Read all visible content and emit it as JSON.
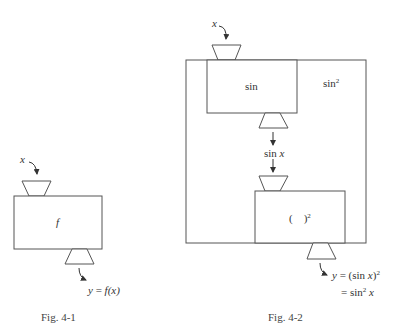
{
  "figures": [
    {
      "id": "fig-4-1",
      "caption": "Fig. 4-1",
      "input_label": "x",
      "box_label": "f",
      "output_label": "y = f(x)",
      "output_var": "y",
      "output_eq": "= ",
      "output_expr": "f(x)"
    },
    {
      "id": "fig-4-2",
      "caption": "Fig. 4-2",
      "input_label": "x",
      "outer_box_label": "sin",
      "outer_box_label_sup": "2",
      "inner_box_1_label": "sin",
      "intermediate_label_fn": "sin",
      "intermediate_label_var": "x",
      "inner_box_2_label": "(    )",
      "inner_box_2_sup": "2",
      "output_line_1_var": "y",
      "output_line_1_rest": " = (sin ",
      "output_line_1_x": "x",
      "output_line_1_close": ")",
      "output_line_1_sup": "2",
      "output_line_2_rest": "= sin",
      "output_line_2_sup": "2",
      "output_line_2_x": "x"
    }
  ],
  "colors": {
    "stroke": "#555555",
    "text": "#333333",
    "background": "#ffffff"
  }
}
